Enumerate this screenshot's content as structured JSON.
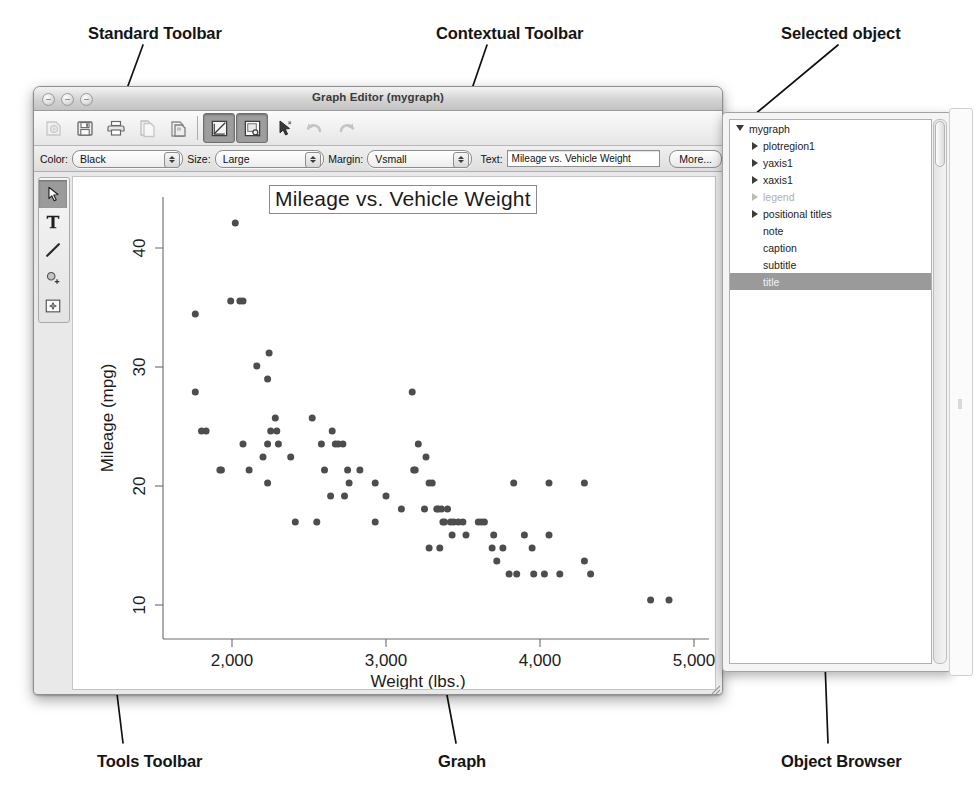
{
  "figure": {
    "top_crop_text": "",
    "callouts": [
      {
        "id": "standard-toolbar",
        "label": "Standard Toolbar"
      },
      {
        "id": "contextual-toolbar",
        "label": "Contextual Toolbar"
      },
      {
        "id": "selected-object",
        "label": "Selected object"
      },
      {
        "id": "tools-toolbar",
        "label": "Tools Toolbar"
      },
      {
        "id": "graph",
        "label": "Graph"
      },
      {
        "id": "object-browser",
        "label": "Object Browser"
      }
    ]
  },
  "window": {
    "title": "Graph Editor (mygraph)",
    "traffic_lights": [
      "close-button",
      "minimize-button",
      "zoom-button"
    ]
  },
  "standard_toolbar": {
    "buttons": [
      {
        "name": "open-icon",
        "label": "Open",
        "state": "disabled"
      },
      {
        "name": "save-icon",
        "label": "Save",
        "state": "normal"
      },
      {
        "name": "print-icon",
        "label": "Print",
        "state": "normal"
      },
      {
        "name": "copy-icon",
        "label": "Copy",
        "state": "normal"
      },
      {
        "name": "paste-icon",
        "label": "Paste",
        "state": "normal"
      },
      {
        "name": "grid-edit-icon",
        "label": "Grid Edit",
        "state": "active"
      },
      {
        "name": "preview-icon",
        "label": "Preview",
        "state": "active"
      },
      {
        "name": "pointer-icon",
        "label": "Pointer",
        "state": "normal"
      },
      {
        "name": "undo-icon",
        "label": "Undo",
        "state": "disabled"
      },
      {
        "name": "redo-icon",
        "label": "Redo",
        "state": "disabled"
      }
    ]
  },
  "contextual_toolbar": {
    "color_label": "Color:",
    "color_value": "Black",
    "size_label": "Size:",
    "size_value": "Large",
    "margin_label": "Margin:",
    "margin_value": "Vsmall",
    "text_label": "Text:",
    "text_value": "Mileage vs. Vehicle Weight",
    "more_label": "More..."
  },
  "tools_toolbar": {
    "tools": [
      {
        "name": "pointer-tool-icon",
        "label": "Pointer",
        "selected": true
      },
      {
        "name": "text-tool-icon",
        "label": "Add Text",
        "selected": false
      },
      {
        "name": "line-tool-icon",
        "label": "Add Line",
        "selected": false
      },
      {
        "name": "marker-tool-icon",
        "label": "Add Marker",
        "selected": false
      },
      {
        "name": "grid-tool-icon",
        "label": "Grid Edit",
        "selected": false
      }
    ]
  },
  "object_browser": {
    "items": [
      {
        "label": "mygraph",
        "depth": 0,
        "disclosure": "open",
        "selected": false,
        "dim": false
      },
      {
        "label": "plotregion1",
        "depth": 1,
        "disclosure": "closed",
        "selected": false,
        "dim": false
      },
      {
        "label": "yaxis1",
        "depth": 1,
        "disclosure": "closed",
        "selected": false,
        "dim": false
      },
      {
        "label": "xaxis1",
        "depth": 1,
        "disclosure": "closed",
        "selected": false,
        "dim": false
      },
      {
        "label": "legend",
        "depth": 1,
        "disclosure": "closed",
        "selected": false,
        "dim": true
      },
      {
        "label": "positional titles",
        "depth": 1,
        "disclosure": "closed",
        "selected": false,
        "dim": false
      },
      {
        "label": "note",
        "depth": 1,
        "disclosure": "none",
        "selected": false,
        "dim": false
      },
      {
        "label": "caption",
        "depth": 1,
        "disclosure": "none",
        "selected": false,
        "dim": false
      },
      {
        "label": "subtitle",
        "depth": 1,
        "disclosure": "none",
        "selected": false,
        "dim": false
      },
      {
        "label": "title",
        "depth": 1,
        "disclosure": "none",
        "selected": true,
        "dim": false
      }
    ]
  },
  "chart_data": {
    "type": "scatter",
    "title": "Mileage vs. Vehicle Weight",
    "xlabel": "Weight (lbs.)",
    "ylabel": "Mileage (mpg)",
    "xlim": [
      1550,
      5100
    ],
    "ylim": [
      9,
      43
    ],
    "xticks": [
      2000,
      3000,
      4000,
      5000
    ],
    "xticklabels": [
      "2,000",
      "3,000",
      "4,000",
      "5,000"
    ],
    "yticks": [
      10,
      20,
      30,
      40
    ],
    "yticklabels": [
      "10",
      "20",
      "30",
      "40"
    ],
    "grid": false,
    "legend": false,
    "marker_color": "#4d4d4d",
    "marker_size": 7,
    "points": [
      [
        1760,
        28
      ],
      [
        1800,
        25
      ],
      [
        1830,
        25
      ],
      [
        1760,
        34
      ],
      [
        2020,
        41
      ],
      [
        1990,
        35
      ],
      [
        2050,
        35
      ],
      [
        2070,
        35
      ],
      [
        2160,
        30
      ],
      [
        2230,
        29
      ],
      [
        2240,
        31
      ],
      [
        2230,
        24
      ],
      [
        2200,
        23
      ],
      [
        2070,
        24
      ],
      [
        2110,
        22
      ],
      [
        2280,
        26
      ],
      [
        2250,
        25
      ],
      [
        2290,
        25
      ],
      [
        2300,
        24
      ],
      [
        2380,
        23
      ],
      [
        2410,
        18
      ],
      [
        2520,
        26
      ],
      [
        2580,
        24
      ],
      [
        2600,
        22
      ],
      [
        2650,
        25
      ],
      [
        2670,
        24
      ],
      [
        2690,
        24
      ],
      [
        2720,
        24
      ],
      [
        2750,
        22
      ],
      [
        2760,
        21
      ],
      [
        2730,
        20
      ],
      [
        2640,
        20
      ],
      [
        2830,
        22
      ],
      [
        2930,
        21
      ],
      [
        2930,
        18
      ],
      [
        3000,
        20
      ],
      [
        3170,
        28
      ],
      [
        3180,
        22
      ],
      [
        3190,
        22
      ],
      [
        3250,
        19
      ],
      [
        3260,
        23
      ],
      [
        3280,
        21
      ],
      [
        3300,
        21
      ],
      [
        3330,
        19
      ],
      [
        3340,
        19
      ],
      [
        3360,
        19
      ],
      [
        3370,
        18
      ],
      [
        3380,
        18
      ],
      [
        3400,
        19
      ],
      [
        3420,
        18
      ],
      [
        3430,
        17
      ],
      [
        3440,
        18
      ],
      [
        3350,
        16
      ],
      [
        3280,
        16
      ],
      [
        3470,
        18
      ],
      [
        3500,
        18
      ],
      [
        3520,
        17
      ],
      [
        3600,
        18
      ],
      [
        3620,
        18
      ],
      [
        3640,
        18
      ],
      [
        3700,
        17
      ],
      [
        3690,
        16
      ],
      [
        3720,
        15
      ],
      [
        3760,
        16
      ],
      [
        3800,
        14
      ],
      [
        3850,
        14
      ],
      [
        3830,
        21
      ],
      [
        3900,
        17
      ],
      [
        3950,
        16
      ],
      [
        3960,
        14
      ],
      [
        4030,
        14
      ],
      [
        4060,
        21
      ],
      [
        4130,
        14
      ],
      [
        4290,
        21
      ],
      [
        4330,
        14
      ],
      [
        4060,
        17
      ],
      [
        4290,
        15
      ],
      [
        4720,
        12
      ],
      [
        4840,
        12
      ],
      [
        3210,
        24
      ],
      [
        3100,
        19
      ],
      [
        2550,
        18
      ],
      [
        2230,
        21
      ],
      [
        1930,
        22
      ],
      [
        1920,
        22
      ]
    ],
    "annotations": [
      {
        "name": "title-selection-box",
        "text": "Mileage vs. Vehicle Weight",
        "selected": true
      }
    ]
  }
}
